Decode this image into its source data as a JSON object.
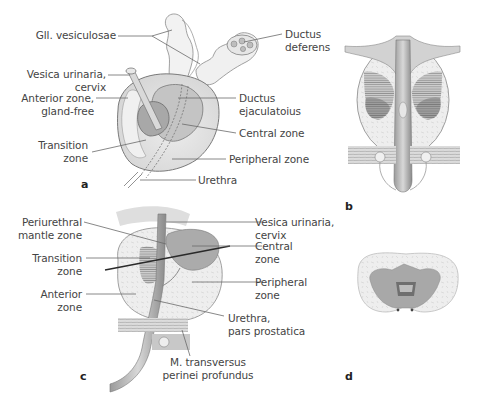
{
  "figure": {
    "panels": [
      {
        "id": "a",
        "label": "a"
      },
      {
        "id": "b",
        "label": "b"
      },
      {
        "id": "c",
        "label": "c"
      },
      {
        "id": "d",
        "label": "d"
      }
    ]
  },
  "panel_a": {
    "labels": {
      "gll_vesiculosae": "Gll. vesiculosae",
      "ductus_deferens_1": "Ductus",
      "ductus_deferens_2": "deferens",
      "vesica_1": "Vesica urinaria,",
      "vesica_2": "cervix",
      "anterior_1": "Anterior zone,",
      "anterior_2": "gland-free",
      "ductus_ejac_1": "Ductus",
      "ductus_ejac_2": "ejaculatoius",
      "central": "Central zone",
      "transition_1": "Transition",
      "transition_2": "zone",
      "peripheral": "Peripheral zone",
      "urethra": "Urethra"
    }
  },
  "panel_c": {
    "labels": {
      "periurethral_1": "Periurethral",
      "periurethral_2": "mantle zone",
      "transition_1": "Transition",
      "transition_2": "zone",
      "anterior_1": "Anterior",
      "anterior_2": "zone",
      "vesica_1": "Vesica urinaria,",
      "vesica_2": "cervix",
      "central_1": "Central",
      "central_2": "zone",
      "peripheral_1": "Peripheral",
      "peripheral_2": "zone",
      "urethra_1": "Urethra,",
      "urethra_2": "pars prostatica",
      "transversus_1": "M. transversus",
      "transversus_2": "perinei profundus"
    }
  },
  "colors": {
    "peripheral_fill": "#e6e6e6",
    "central_fill": "#b9b9b9",
    "transition_fill": "#a6a6a6",
    "outline": "#6e6e6e",
    "leader_line": "#6a6a6a",
    "text": "#444444"
  }
}
